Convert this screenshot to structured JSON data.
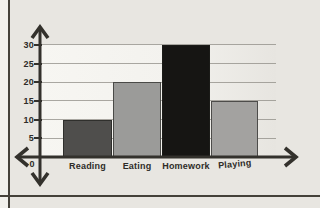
{
  "frame": {
    "background": "#e8e6e1",
    "page_edge_color": "#44413a",
    "plot_area_tint": "#f6f5f1"
  },
  "chart_data": {
    "type": "bar",
    "title": "",
    "xlabel": "",
    "ylabel": "",
    "categories": [
      "Reading",
      "Eating",
      "Homework",
      "Playing"
    ],
    "values": [
      10,
      20,
      30,
      15
    ],
    "bar_colors": [
      "#4f4e4c",
      "#9b9b99",
      "#161513",
      "#a3a2a0"
    ],
    "ylim": [
      0,
      30
    ],
    "yticks": [
      0,
      5,
      10,
      15,
      20,
      25,
      30
    ],
    "grid": true,
    "legend": false,
    "origin_label": "0",
    "axis_color": "#33312c",
    "gridline_color": "#8f8c86",
    "label_color": "#2e2c28"
  }
}
